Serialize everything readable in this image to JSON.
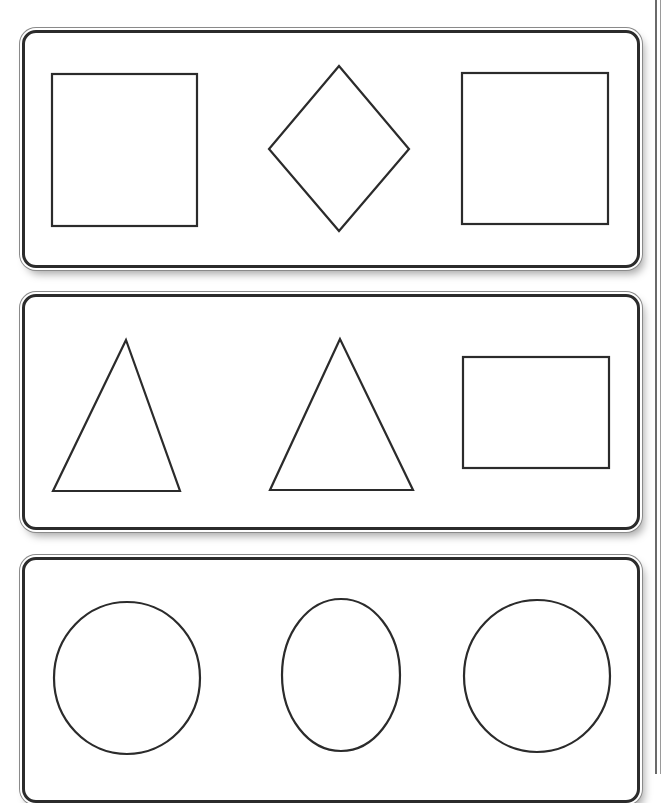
{
  "worksheet": {
    "title": "",
    "rows": [
      {
        "name": "row-1",
        "shapes": [
          "square",
          "diamond",
          "square"
        ]
      },
      {
        "name": "row-2",
        "shapes": [
          "triangle",
          "triangle",
          "rectangle"
        ]
      },
      {
        "name": "row-3",
        "shapes": [
          "circle",
          "oval",
          "circle"
        ]
      }
    ],
    "colors": {
      "stroke": "#2b2b2b",
      "background": "#ffffff"
    }
  }
}
